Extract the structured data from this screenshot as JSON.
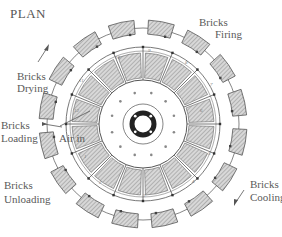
{
  "title": "PLAN",
  "labels": {
    "firing": [
      "Bricks",
      "Firing"
    ],
    "drying": [
      "Bricks",
      "Drying"
    ],
    "loading": [
      "Bricks",
      "Loading"
    ],
    "air_in": "Air in",
    "unloading": [
      "Bricks",
      "Unloading"
    ],
    "cooling": [
      "Bricks",
      "Cooling"
    ]
  },
  "chamber_numbers": [
    "1",
    "2",
    "3",
    "4",
    "5",
    "6",
    "7",
    "8",
    "9",
    "10",
    "11",
    "12"
  ],
  "colors": {
    "line": "#555555",
    "hatch": "#bdbdbd",
    "hub_ring": "#222222"
  }
}
